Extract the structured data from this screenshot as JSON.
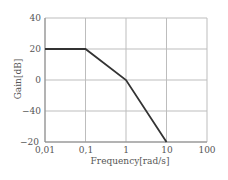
{
  "chart_data": {
    "type": "line",
    "title": "",
    "xlabel": "Frequency[rad/s]",
    "ylabel": "Gain[dB]",
    "xscale": "log",
    "xlim": [
      0.01,
      100
    ],
    "x_tick_labels": [
      "0,01",
      "0,1",
      "1",
      "10",
      "100"
    ],
    "y_tick_labels": [
      "40",
      "20",
      "0",
      "−40",
      "−20"
    ],
    "grid": true,
    "legend": null,
    "series": [
      {
        "name": "Gain",
        "x": [
          0.01,
          0.1,
          1,
          10
        ],
        "y": [
          20,
          20,
          0,
          -40
        ],
        "color": "#333333"
      }
    ]
  },
  "frame": {
    "left": 45,
    "top": 18,
    "right": 207,
    "bottom": 142
  },
  "colors": {
    "grid": "#bdbdbd",
    "line": "#333333",
    "text": "#555555"
  }
}
